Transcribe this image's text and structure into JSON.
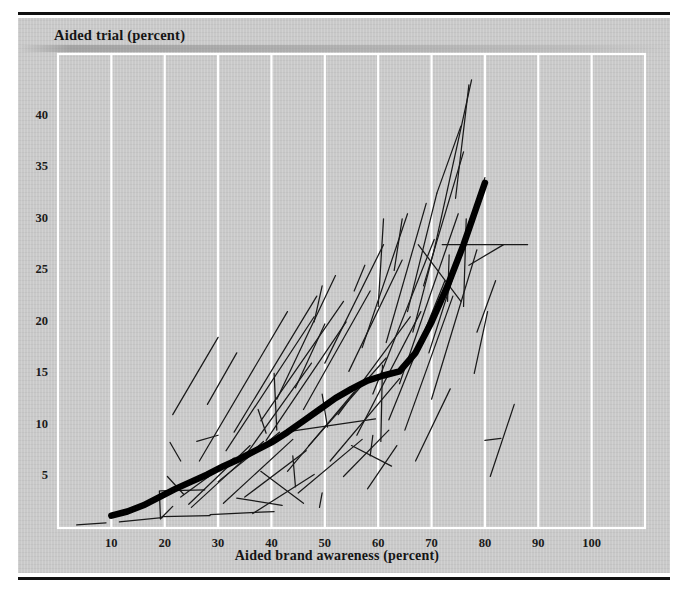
{
  "figure": {
    "plate_color": "#c9c9c9",
    "rule_color": "#111111",
    "gridline_color": "#ffffff",
    "curve_color": "#000000",
    "segment_color": "#1a1a1a"
  },
  "chart_data": {
    "type": "line",
    "title": "",
    "xlabel": "Aided brand awareness (percent)",
    "ylabel": "Aided trial (percent)",
    "xlim": [
      0,
      110
    ],
    "ylim": [
      0,
      46
    ],
    "xticks": [
      10,
      20,
      30,
      40,
      50,
      60,
      70,
      80,
      90,
      100
    ],
    "xticklabels": [
      "10",
      "20",
      "30",
      "40",
      "50",
      "60",
      "70",
      "80",
      "90",
      "100"
    ],
    "yticks": [
      5,
      10,
      15,
      20,
      25,
      30,
      35,
      40
    ],
    "yticklabels": [
      "5",
      "10",
      "15",
      "20",
      "25",
      "30",
      "35",
      "40"
    ],
    "grid": "vertical",
    "legend": "none",
    "series": [
      {
        "name": "Fitted aided trial curve",
        "type": "curve",
        "linewidth": "thick",
        "points": [
          [
            10.0,
            1.2
          ],
          [
            13.0,
            1.6
          ],
          [
            16.0,
            2.2
          ],
          [
            19.0,
            3.0
          ],
          [
            22.0,
            3.8
          ],
          [
            25.0,
            4.5
          ],
          [
            28.0,
            5.2
          ],
          [
            31.0,
            6.0
          ],
          [
            34.0,
            6.7
          ],
          [
            37.0,
            7.5
          ],
          [
            40.0,
            8.3
          ],
          [
            43.0,
            9.3
          ],
          [
            46.0,
            10.4
          ],
          [
            49.0,
            11.5
          ],
          [
            52.0,
            12.6
          ],
          [
            55.0,
            13.5
          ],
          [
            58.0,
            14.3
          ],
          [
            61.0,
            14.8
          ],
          [
            64.0,
            15.2
          ],
          [
            67.0,
            17.0
          ],
          [
            70.0,
            20.0
          ],
          [
            73.0,
            23.5
          ],
          [
            76.0,
            27.5
          ],
          [
            78.0,
            30.5
          ],
          [
            80.0,
            33.5
          ]
        ]
      },
      {
        "name": "Individual brand trajectories",
        "type": "segments",
        "linewidth": "thin",
        "segments": [
          [
            [
              3.5,
              0.3
            ],
            [
              9.0,
              0.5
            ]
          ],
          [
            [
              11.5,
              0.6
            ],
            [
              19.5,
              1.0
            ]
          ],
          [
            [
              19.0,
              3.6
            ],
            [
              19.2,
              0.9
            ]
          ],
          [
            [
              19.2,
              0.9
            ],
            [
              21.5,
              2.1
            ]
          ],
          [
            [
              19.2,
              3.6
            ],
            [
              27.5,
              3.7
            ]
          ],
          [
            [
              19.5,
              1.1
            ],
            [
              28.5,
              1.2
            ]
          ],
          [
            [
              20.5,
              5.0
            ],
            [
              23.5,
              3.3
            ]
          ],
          [
            [
              21.0,
              8.3
            ],
            [
              23.0,
              6.5
            ]
          ],
          [
            [
              21.5,
              11.0
            ],
            [
              30.0,
              18.5
            ]
          ],
          [
            [
              23.0,
              3.0
            ],
            [
              33.0,
              6.8
            ]
          ],
          [
            [
              24.5,
              2.3
            ],
            [
              36.0,
              8.0
            ]
          ],
          [
            [
              25.0,
              2.0
            ],
            [
              38.5,
              8.4
            ]
          ],
          [
            [
              26.5,
              6.5
            ],
            [
              43.0,
              21.0
            ]
          ],
          [
            [
              28.0,
              12.0
            ],
            [
              33.5,
              17.0
            ]
          ],
          [
            [
              28.5,
              1.3
            ],
            [
              40.5,
              1.6
            ]
          ],
          [
            [
              30.0,
              4.5
            ],
            [
              41.5,
              9.3
            ]
          ],
          [
            [
              31.0,
              2.4
            ],
            [
              44.0,
              8.6
            ]
          ],
          [
            [
              31.5,
              7.5
            ],
            [
              48.0,
              20.5
            ]
          ],
          [
            [
              33.0,
              9.3
            ],
            [
              48.5,
              22.5
            ]
          ],
          [
            [
              34.5,
              6.6
            ],
            [
              47.5,
              16.0
            ]
          ],
          [
            [
              35.0,
              3.0
            ],
            [
              46.5,
              7.5
            ]
          ],
          [
            [
              36.5,
              1.4
            ],
            [
              48.0,
              5.2
            ]
          ],
          [
            [
              37.5,
              11.5
            ],
            [
              39.0,
              9.2
            ]
          ],
          [
            [
              38.0,
              10.4
            ],
            [
              53.5,
              22.0
            ]
          ],
          [
            [
              39.0,
              8.5
            ],
            [
              54.0,
              20.0
            ]
          ],
          [
            [
              40.5,
              15.0
            ],
            [
              41.0,
              9.5
            ]
          ],
          [
            [
              41.0,
              12.5
            ],
            [
              52.0,
              24.5
            ]
          ],
          [
            [
              42.5,
              9.3
            ],
            [
              59.5,
              10.6
            ]
          ],
          [
            [
              43.0,
              5.5
            ],
            [
              55.5,
              13.2
            ]
          ],
          [
            [
              44.5,
              13.6
            ],
            [
              50.0,
              19.8
            ]
          ],
          [
            [
              45.0,
              3.4
            ],
            [
              57.0,
              8.6
            ]
          ],
          [
            [
              46.0,
              11.5
            ],
            [
              58.5,
              23.0
            ]
          ],
          [
            [
              47.0,
              8.0
            ],
            [
              61.5,
              16.5
            ]
          ],
          [
            [
              48.0,
              20.0
            ],
            [
              49.5,
              23.5
            ]
          ],
          [
            [
              49.5,
              13.0
            ],
            [
              50.5,
              9.8
            ]
          ],
          [
            [
              50.0,
              16.0
            ],
            [
              61.0,
              27.5
            ]
          ],
          [
            [
              51.0,
              6.5
            ],
            [
              64.0,
              14.5
            ]
          ],
          [
            [
              52.5,
              11.0
            ],
            [
              66.0,
              20.5
            ]
          ],
          [
            [
              53.5,
              5.0
            ],
            [
              62.0,
              9.5
            ]
          ],
          [
            [
              54.5,
              15.2
            ],
            [
              64.5,
              26.0
            ]
          ],
          [
            [
              55.5,
              23.0
            ],
            [
              57.5,
              25.5
            ]
          ],
          [
            [
              56.0,
              9.0
            ],
            [
              68.0,
              21.0
            ]
          ],
          [
            [
              57.0,
              17.5
            ],
            [
              65.5,
              30.5
            ]
          ],
          [
            [
              58.0,
              3.8
            ],
            [
              63.5,
              8.0
            ]
          ],
          [
            [
              59.0,
              13.0
            ],
            [
              70.5,
              28.0
            ]
          ],
          [
            [
              60.0,
              21.5
            ],
            [
              61.0,
              30.0
            ]
          ],
          [
            [
              60.5,
              8.4
            ],
            [
              60.8,
              15.8
            ]
          ],
          [
            [
              61.5,
              18.0
            ],
            [
              69.0,
              31.5
            ]
          ],
          [
            [
              62.0,
              10.5
            ],
            [
              72.5,
              24.0
            ]
          ],
          [
            [
              63.0,
              25.0
            ],
            [
              64.5,
              30.0
            ]
          ],
          [
            [
              64.0,
              14.0
            ],
            [
              75.0,
              30.5
            ]
          ],
          [
            [
              65.0,
              9.5
            ],
            [
              74.0,
              22.5
            ]
          ],
          [
            [
              65.5,
              21.0
            ],
            [
              71.0,
              32.5
            ]
          ],
          [
            [
              66.5,
              19.0
            ],
            [
              70.5,
              27.0
            ]
          ],
          [
            [
              67.0,
              6.5
            ],
            [
              73.5,
              13.5
            ]
          ],
          [
            [
              67.5,
              27.5
            ],
            [
              75.5,
              22.0
            ]
          ],
          [
            [
              68.5,
              23.5
            ],
            [
              76.0,
              36.5
            ]
          ],
          [
            [
              69.5,
              17.0
            ],
            [
              80.0,
              34.0
            ]
          ],
          [
            [
              70.0,
              12.5
            ],
            [
              78.5,
              27.0
            ]
          ],
          [
            [
              70.5,
              27.0
            ],
            [
              77.5,
              43.5
            ]
          ],
          [
            [
              71.0,
              32.5
            ],
            [
              75.5,
              39.0
            ]
          ],
          [
            [
              72.0,
              27.5
            ],
            [
              88.0,
              27.5
            ]
          ],
          [
            [
              73.0,
              22.0
            ],
            [
              73.3,
              26.5
            ]
          ],
          [
            [
              74.5,
              32.0
            ],
            [
              77.0,
              43.0
            ]
          ],
          [
            [
              76.0,
              21.5
            ],
            [
              76.5,
              30.0
            ]
          ],
          [
            [
              77.0,
              25.5
            ],
            [
              83.5,
              27.5
            ]
          ],
          [
            [
              78.0,
              15.0
            ],
            [
              80.5,
              21.0
            ]
          ],
          [
            [
              78.5,
              19.0
            ],
            [
              82.0,
              24.0
            ]
          ],
          [
            [
              80.0,
              8.5
            ],
            [
              83.0,
              8.7
            ]
          ],
          [
            [
              81.0,
              5.0
            ],
            [
              85.5,
              12.0
            ]
          ],
          [
            [
              38.0,
              5.5
            ],
            [
              46.0,
              2.4
            ]
          ],
          [
            [
              44.0,
              7.0
            ],
            [
              44.5,
              4.0
            ]
          ],
          [
            [
              58.5,
              7.0
            ],
            [
              59.0,
              9.0
            ]
          ],
          [
            [
              55.0,
              8.0
            ],
            [
              62.5,
              6.0
            ]
          ],
          [
            [
              33.5,
              2.9
            ],
            [
              42.0,
              2.2
            ]
          ],
          [
            [
              26.0,
              8.4
            ],
            [
              30.0,
              9.0
            ]
          ],
          [
            [
              49.0,
              2.0
            ],
            [
              49.5,
              3.4
            ]
          ]
        ]
      }
    ]
  },
  "axis_titles": {
    "y": "Aided trial (percent)",
    "x": "Aided brand awareness (percent)"
  }
}
